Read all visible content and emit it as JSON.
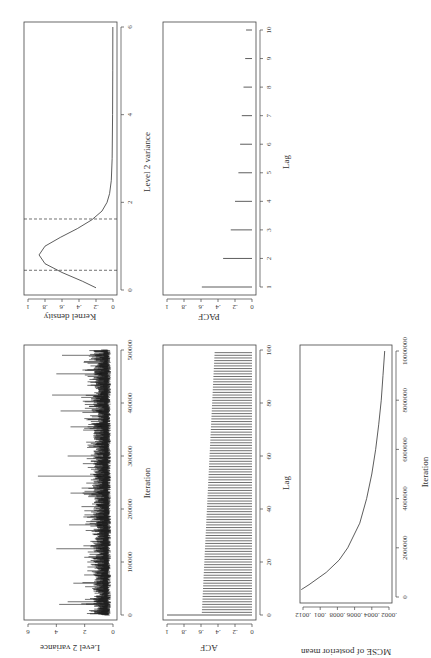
{
  "chart_data": [
    {
      "id": "trace",
      "type": "line",
      "title": "",
      "xlabel": "Iteration",
      "ylabel": "Level 2 variance",
      "xlim": [
        0,
        500000
      ],
      "ylim": [
        0,
        6
      ],
      "xticks": [
        "0",
        "100000",
        "200000",
        "300000",
        "400000",
        "500000"
      ],
      "yticks": [
        "0",
        "2",
        "4",
        "6"
      ],
      "description": "MCMC trace; values mostly between ~0.2 and ~2 with spikes",
      "spikes": [
        {
          "x": 20000,
          "y": 3.8
        },
        {
          "x": 25000,
          "y": 3.2
        },
        {
          "x": 60000,
          "y": 2.8
        },
        {
          "x": 125000,
          "y": 4.0
        },
        {
          "x": 170000,
          "y": 3.1
        },
        {
          "x": 230000,
          "y": 3.0
        },
        {
          "x": 262000,
          "y": 5.3
        },
        {
          "x": 300000,
          "y": 3.2
        },
        {
          "x": 355000,
          "y": 3.0
        },
        {
          "x": 385000,
          "y": 3.7
        },
        {
          "x": 415000,
          "y": 4.3
        },
        {
          "x": 455000,
          "y": 4.0
        },
        {
          "x": 490000,
          "y": 3.6
        }
      ]
    },
    {
      "id": "density",
      "type": "line",
      "title": "",
      "xlabel": "Level 2 variance",
      "ylabel": "Kernel density",
      "xlim": [
        0,
        6
      ],
      "ylim": [
        0,
        1
      ],
      "xticks": [
        "0",
        "2",
        "4",
        "6"
      ],
      "yticks": [
        "0",
        ".2",
        ".4",
        ".6",
        ".8",
        "1"
      ],
      "x": [
        0.05,
        0.2,
        0.4,
        0.6,
        0.8,
        1.0,
        1.2,
        1.4,
        1.6,
        1.8,
        2.0,
        2.2,
        2.5,
        3.0,
        4.0,
        5.0,
        6.0
      ],
      "y": [
        0.2,
        0.36,
        0.6,
        0.8,
        0.87,
        0.8,
        0.62,
        0.42,
        0.25,
        0.13,
        0.07,
        0.04,
        0.02,
        0.01,
        0.005,
        0.003,
        0.002
      ],
      "vlines": [
        0.45,
        1.62
      ],
      "vline_style": "dashed"
    },
    {
      "id": "acf",
      "type": "bar",
      "title": "",
      "xlabel": "Lag",
      "ylabel": "ACF",
      "xlim": [
        0,
        100
      ],
      "ylim": [
        0,
        1
      ],
      "xticks": [
        "0",
        "20",
        "40",
        "60",
        "80",
        "100"
      ],
      "yticks": [
        "0",
        ".2",
        ".4",
        ".6",
        ".8",
        "1"
      ],
      "lag0": 1.0,
      "lag1_value": 0.59,
      "lag99_value": 0.44,
      "lags": 99
    },
    {
      "id": "pacf",
      "type": "bar",
      "title": "",
      "xlabel": "Lag",
      "ylabel": "PACF",
      "xlim": [
        1,
        10
      ],
      "ylim": [
        0,
        1
      ],
      "xticks": [
        "1",
        "2",
        "3",
        "4",
        "5",
        "6",
        "7",
        "8",
        "9",
        "10"
      ],
      "yticks": [
        "0",
        ".2",
        ".4",
        ".6",
        ".8",
        "1"
      ],
      "categories": [
        1,
        2,
        3,
        4,
        5,
        6,
        7,
        8,
        9,
        10
      ],
      "values": [
        0.59,
        0.34,
        0.25,
        0.2,
        0.16,
        0.14,
        0.12,
        0.1,
        0.08,
        0.07
      ]
    },
    {
      "id": "mcse",
      "type": "line",
      "title": "",
      "xlabel": "Iteration",
      "ylabel": "MCSE of posterior mean",
      "xlim": [
        0,
        10000000
      ],
      "ylim": [
        0.0002,
        0.0012
      ],
      "xticks": [
        "0",
        "2000000",
        "4000000",
        "6000000",
        "8000000",
        "10000000"
      ],
      "yticks": [
        ".0002",
        ".0004",
        ".0006",
        ".0008",
        ".001",
        ".0012"
      ],
      "x": [
        300000,
        500000,
        1000000,
        1500000,
        2000000,
        3000000,
        4000000,
        5000000,
        6000000,
        7000000,
        8000000,
        9000000,
        10000000
      ],
      "y": [
        0.00122,
        0.00113,
        0.00093,
        0.00078,
        0.00068,
        0.00054,
        0.00046,
        0.0004,
        0.000355,
        0.00032,
        0.00029,
        0.00027,
        0.00025
      ]
    }
  ],
  "labels": {
    "trace_x": "Iteration",
    "trace_y": "Level 2 variance",
    "density_x": "Level 2 variance",
    "density_y": "Kernel density",
    "acf_x": "Lag",
    "acf_y": "ACF",
    "pacf_x": "Lag",
    "pacf_y": "PACF",
    "mcse_x": "Iteration",
    "mcse_y": "MCSE of posterior mean"
  }
}
